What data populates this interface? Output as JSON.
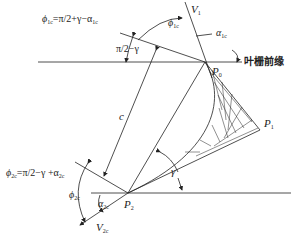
{
  "diagram": {
    "title": "叶栅前缘",
    "labels": {
      "phi1c_formula": "ϕ1c=π/2+γ−α1c",
      "phi1c_formula_parts": {
        "lhs": "ϕ",
        "lhs_sub": "1c",
        "rhs": "=π/2+γ−α",
        "rhs_sub": "1c"
      },
      "phi1c": {
        "sym": "ϕ",
        "sub": "1c"
      },
      "pi2_minus_gamma": "π/2−γ",
      "V1": {
        "sym": "V",
        "sub": "1"
      },
      "alpha1c": {
        "sym": "α",
        "sub": "1c"
      },
      "cascade_leading_edge": "叶栅前缘",
      "P0": {
        "sym": "P",
        "sub": "0"
      },
      "P1": {
        "sym": "P",
        "sub": "1"
      },
      "P2": {
        "sym": "P",
        "sub": "2"
      },
      "c": "c",
      "gamma": "γ",
      "phi2c_formula_parts": {
        "lhs": "ϕ",
        "lhs_sub": "2c",
        "rhs": "=π/2−γ +α",
        "rhs_sub": "2c"
      },
      "phi2c": {
        "sym": "ϕ",
        "sub": "2c"
      },
      "alpha2c": {
        "sym": "α",
        "sub": "2c"
      },
      "V2c": {
        "sym": "V",
        "sub": "2c"
      }
    },
    "colors": {
      "line": "#222222",
      "background": "#ffffff"
    }
  }
}
